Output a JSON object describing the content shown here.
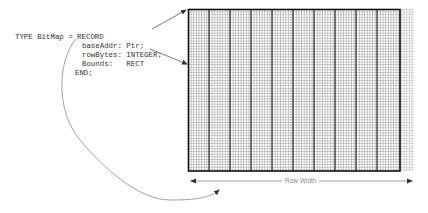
{
  "code": {
    "line1": "TYPE BitMap = RECORD",
    "line2": "baseAddr: Ptr;",
    "line3": "rowBytes: INTEGER;",
    "line4": "Bounds:   RECT",
    "line5": "END;"
  },
  "bitmap": {
    "fine_cell_px": 2.63,
    "bits_per_block": 8,
    "block_px": 21,
    "main_left": 188,
    "main_top": 9,
    "main_right": 400,
    "main_bottom": 171,
    "extra_right": 414,
    "grid_color": "#9a9a9a",
    "block_line_color": "#222222",
    "border_color": "#111111"
  },
  "row_width": {
    "label": "Row Width",
    "color": "#999999"
  },
  "colors": {
    "arrow": "#555555",
    "curve": "#888888"
  }
}
